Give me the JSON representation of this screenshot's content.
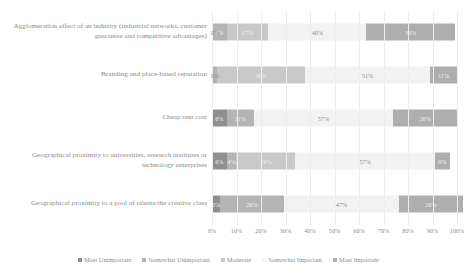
{
  "chart_data": {
    "type": "bar",
    "subtype": "100% stacked horizontal bar",
    "title": "",
    "xlabel": "",
    "ylabel": "",
    "xlim": [
      0,
      100
    ],
    "grid": true,
    "legend_position": "bottom",
    "xticks": [
      "0%",
      "10%",
      "20%",
      "30%",
      "40%",
      "50%",
      "60%",
      "70%",
      "80%",
      "90%",
      "100%"
    ],
    "categories": [
      "Agglomeration effect of an industry (industrial networks, customer guarantee and competitive advantages)",
      "Branding and place-based reputation",
      "Cheap rent cost",
      "Geographical proximity to universities, research institutes or technology enterprises",
      "Geographical proximity to a pool of talents/the creative class"
    ],
    "series": [
      {
        "name": "Most Unimportant",
        "color": "#8f8f8f",
        "values": [
          0,
          0,
          6,
          6,
          2
        ]
      },
      {
        "name": "Somewhat Unimportant",
        "color": "#b4b4b4",
        "values": [
          6,
          2,
          11,
          4,
          26
        ]
      },
      {
        "name": "Moderate",
        "color": "#c9c9c9",
        "values": [
          17,
          36,
          0,
          24,
          0
        ]
      },
      {
        "name": "Somewhat Important",
        "color": "#f2f2f2",
        "values": [
          40,
          51,
          57,
          57,
          47
        ]
      },
      {
        "name": "Most Important",
        "color": "#aeaeae",
        "values": [
          36,
          11,
          26,
          6,
          26
        ]
      }
    ],
    "bar_labels": [
      [
        "0%",
        "6%",
        "17%",
        "40%",
        "36%"
      ],
      [
        "0%",
        "",
        "36%",
        "51%",
        "11%"
      ],
      [
        "6%",
        "11%",
        "",
        "57%",
        "26%"
      ],
      [
        "6%",
        "4%",
        "24%",
        "57%",
        "6%"
      ],
      [
        "2%",
        "26%",
        "",
        "47%",
        "26%"
      ]
    ]
  },
  "legend": {
    "items": [
      {
        "label": "Most Unimportant"
      },
      {
        "label": "Somewhat Unimportant"
      },
      {
        "label": "Moderate"
      },
      {
        "label": "Somewhat Important"
      },
      {
        "label": "Most Important"
      }
    ]
  }
}
